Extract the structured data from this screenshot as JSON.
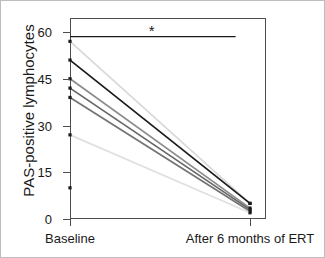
{
  "chart_data": {
    "type": "line",
    "title": "",
    "subtitle": "",
    "xlabel": "",
    "ylabel": "PAS-positive lymphocytes",
    "categories": [
      "Baseline",
      "After 6 months of ERT"
    ],
    "x": [
      0,
      1
    ],
    "xtick_labels": [
      "Baseline",
      "After 6 months of ERT"
    ],
    "ytick_labels": [
      "0",
      "15",
      "30",
      "45",
      "60"
    ],
    "yticks": [
      0,
      15,
      30,
      45,
      60
    ],
    "ylim": [
      0,
      64
    ],
    "xlim": [
      -0.12,
      1.12
    ],
    "grid": false,
    "legend": false,
    "legend_position": "none",
    "series": [
      {
        "name": "subject-1",
        "values": [
          57,
          5
        ],
        "color": "#d9d9d9"
      },
      {
        "name": "subject-2",
        "values": [
          51,
          5
        ],
        "color": "#1a1a1a"
      },
      {
        "name": "subject-3",
        "values": [
          45,
          3.5
        ],
        "color": "#8c8c8c"
      },
      {
        "name": "subject-4",
        "values": [
          42,
          3
        ],
        "color": "#666666"
      },
      {
        "name": "subject-5",
        "values": [
          39,
          2.5
        ],
        "color": "#737373"
      },
      {
        "name": "subject-6",
        "values": [
          27,
          2
        ],
        "color": "#e0e0e0"
      },
      {
        "name": "subject-7",
        "values": [
          10,
          null
        ],
        "color": "#1a1a1a"
      }
    ],
    "marker": "square",
    "marker_color": "#1a1a1a",
    "annotations": [
      {
        "name": "significance-bracket",
        "label": "*",
        "y": 58.5,
        "x_start": 0,
        "x_end": 0.92,
        "color": "#1a1a1a"
      }
    ]
  },
  "figure": {
    "background_color": "#ffffff",
    "border_color": "#bdbdbd",
    "axis_color": "#4d4d4d",
    "text_color": "#1a1a1a"
  }
}
